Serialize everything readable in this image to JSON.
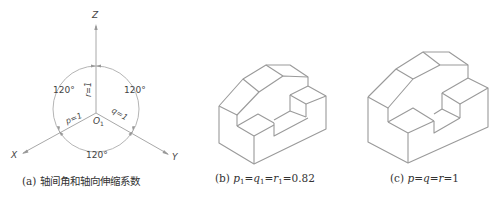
{
  "figure_a": {
    "axis_labels": {
      "z": "Z",
      "x": "X",
      "y": "Y",
      "origin": "O",
      "origin_sub": "1"
    },
    "angles": [
      "120°",
      "120°",
      "120°"
    ],
    "coefficients": {
      "r": "r=1",
      "p": "p=1",
      "q": "q=1"
    },
    "caption": "(a) 轴间角和轴向伸缩系数"
  },
  "figure_b": {
    "caption_prefix": "(b) ",
    "caption_formula": [
      "p",
      "1",
      "=",
      "q",
      "1",
      "=",
      "r",
      "1",
      "=0.82"
    ]
  },
  "figure_c": {
    "caption_prefix": "(c) ",
    "caption_formula": [
      "p",
      "=",
      "q",
      "=",
      "r",
      "=1"
    ]
  },
  "colors": {
    "line": "#9a9a9a",
    "text": "#333333",
    "arrow": "#888888"
  }
}
